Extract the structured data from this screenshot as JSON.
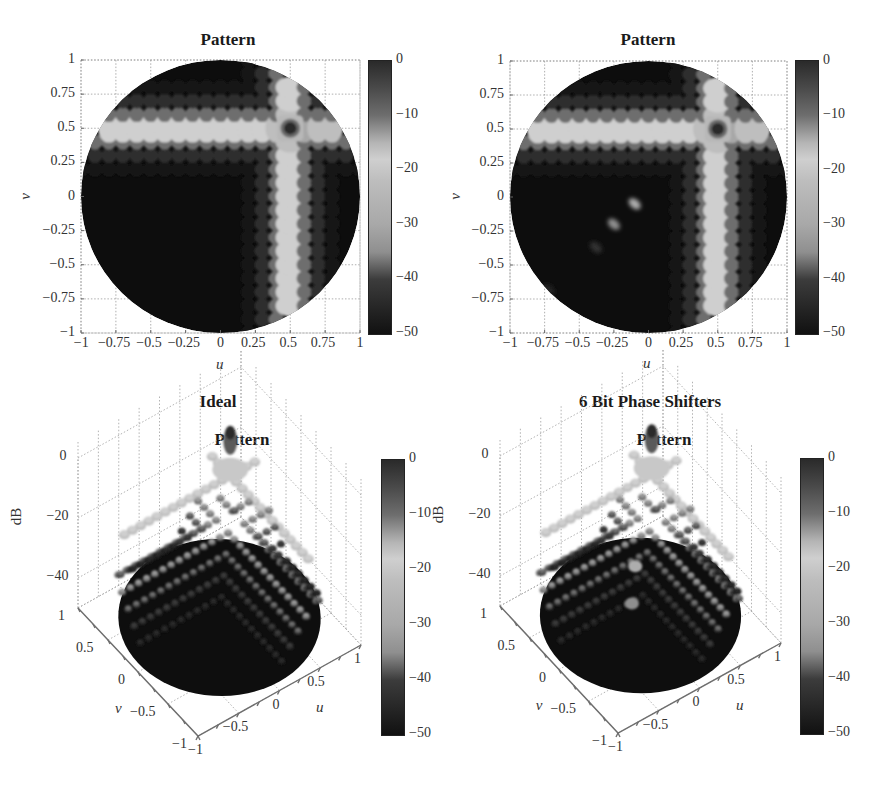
{
  "figure": {
    "column_titles": [
      "Ideal",
      "6 Bit Phase Shifters"
    ],
    "colormap": "jet (rendered in grayscale)",
    "gray_stops": [
      {
        "db": 0,
        "gray": "#2a2a2a"
      },
      {
        "db": -5,
        "gray": "#4a4a4a"
      },
      {
        "db": -10,
        "gray": "#6e6e6e"
      },
      {
        "db": -15,
        "gray": "#b5b5b5"
      },
      {
        "db": -18,
        "gray": "#cfcfcf"
      },
      {
        "db": -22,
        "gray": "#bdbdbd"
      },
      {
        "db": -30,
        "gray": "#a8a8a8"
      },
      {
        "db": -35,
        "gray": "#8f8f8f"
      },
      {
        "db": -40,
        "gray": "#3c3c3c"
      },
      {
        "db": -50,
        "gray": "#111111"
      }
    ]
  },
  "chart_data": [
    {
      "id": "top-left",
      "type": "heatmap",
      "title": "Pattern",
      "xlabel": "u",
      "ylabel": "v",
      "xlim": [
        -1,
        1
      ],
      "ylim": [
        -1,
        1
      ],
      "xticks": [
        "−1",
        "−0.75",
        "−0.5",
        "−0.25",
        "0",
        "0.25",
        "0.5",
        "0.75",
        "1"
      ],
      "yticks": [
        "1",
        "0.75",
        "0.5",
        "0.25",
        "0",
        "−0.25",
        "−0.5",
        "−0.75",
        "−1"
      ],
      "grid": true,
      "colorbar": {
        "ticks": [
          "0",
          "−10",
          "−20",
          "−30",
          "−40",
          "−50"
        ],
        "range_db": [
          -50,
          0
        ]
      },
      "main_beam": {
        "u": 0.5,
        "v": 0.5,
        "db": 0
      },
      "principal_plane_sidelobe_db": -18,
      "sidelobe_spacing": 0.1,
      "visible_region": "unit circle u^2+v^2<=1",
      "spurious_lobes": []
    },
    {
      "id": "top-right",
      "type": "heatmap",
      "title": "Pattern",
      "xlabel": "u",
      "ylabel": "v",
      "xlim": [
        -1,
        1
      ],
      "ylim": [
        -1,
        1
      ],
      "xticks": [
        "−1",
        "−0.75",
        "−0.5",
        "−0.25",
        "0",
        "0.25",
        "0.5",
        "0.75",
        "1"
      ],
      "yticks": [
        "1",
        "0.75",
        "0.5",
        "0.25",
        "0",
        "−0.25",
        "−0.5",
        "−0.75",
        "−1"
      ],
      "grid": true,
      "colorbar": {
        "ticks": [
          "0",
          "−10",
          "−20",
          "−30",
          "−40",
          "−50"
        ],
        "range_db": [
          -50,
          0
        ]
      },
      "main_beam": {
        "u": 0.5,
        "v": 0.5,
        "db": 0
      },
      "principal_plane_sidelobe_db": -18,
      "sidelobe_spacing": 0.1,
      "visible_region": "unit circle u^2+v^2<=1",
      "spurious_lobes": [
        {
          "u": -0.1,
          "v": -0.05,
          "db": -28
        },
        {
          "u": -0.25,
          "v": -0.2,
          "db": -35
        },
        {
          "u": -0.38,
          "v": -0.37,
          "db": -42
        },
        {
          "u": -0.72,
          "v": -0.68,
          "db": -46
        }
      ]
    },
    {
      "id": "bottom-left",
      "type": "surface3d",
      "suptitle": "Ideal",
      "title": "Pattern",
      "xlabel": "u",
      "ylabel": "v",
      "zlabel": "dB",
      "xticks": [
        "−1",
        "−0.5",
        "0",
        "0.5",
        "1"
      ],
      "yticks": [
        "−1",
        "−0.5",
        "0",
        "0.5",
        "1"
      ],
      "zticks": [
        "0",
        "−20",
        "−40"
      ],
      "zlim": [
        -50,
        0
      ],
      "colorbar": {
        "ticks": [
          "0",
          "−10",
          "−20",
          "−30",
          "−40",
          "−50"
        ],
        "range_db": [
          -50,
          0
        ]
      },
      "main_beam": {
        "u": 0.5,
        "v": 0.5,
        "db": 0
      },
      "spurious_lobes": []
    },
    {
      "id": "bottom-right",
      "type": "surface3d",
      "suptitle": "6 Bit Phase Shifters",
      "title": "Pattern",
      "xlabel": "u",
      "ylabel": "v",
      "zlabel": "dB",
      "xticks": [
        "−1",
        "−0.5",
        "0",
        "0.5",
        "1"
      ],
      "yticks": [
        "−1",
        "−0.5",
        "0",
        "0.5",
        "1"
      ],
      "zticks": [
        "0",
        "−20",
        "−40"
      ],
      "zlim": [
        -50,
        0
      ],
      "colorbar": {
        "ticks": [
          "0",
          "−10",
          "−20",
          "−30",
          "−40",
          "−50"
        ],
        "range_db": [
          -50,
          0
        ]
      },
      "main_beam": {
        "u": 0.5,
        "v": 0.5,
        "db": 0
      },
      "spurious_lobes": [
        {
          "u": -0.1,
          "v": -0.05,
          "db": -28
        },
        {
          "u": -0.25,
          "v": -0.2,
          "db": -35
        }
      ]
    }
  ]
}
